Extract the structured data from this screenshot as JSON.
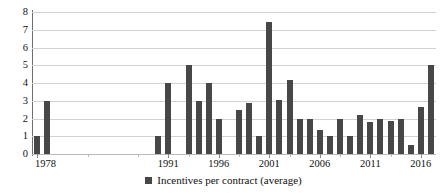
{
  "chart_data": {
    "type": "bar",
    "title": "",
    "xlabel": "",
    "ylabel": "",
    "ylim": [
      0,
      8
    ],
    "yticks": [
      0,
      1,
      2,
      3,
      4,
      5,
      6,
      7,
      8
    ],
    "grid": true,
    "legend_position": "bottom",
    "series_name": "Incentives per contract (average)",
    "bar_color": "#474747",
    "x_tick_labels": [
      "1978",
      "1991",
      "1996",
      "2001",
      "2006",
      "2011",
      "2016"
    ],
    "x_tick_years": [
      1978,
      1991,
      1996,
      2001,
      2006,
      2011,
      2016
    ],
    "x_range": [
      1978,
      2017
    ],
    "categories": [
      "1978",
      "1979",
      "1980",
      "1981",
      "1982",
      "1983",
      "1984",
      "1985",
      "1986",
      "1987",
      "1988",
      "1989",
      "1990",
      "1991",
      "1992",
      "1993",
      "1994",
      "1995",
      "1996",
      "1997",
      "1998",
      "1999",
      "2000",
      "2001",
      "2002",
      "2003",
      "2004",
      "2005",
      "2006",
      "2007",
      "2008",
      "2009",
      "2010",
      "2011",
      "2012",
      "2013",
      "2014",
      "2015",
      "2016",
      "2017"
    ],
    "values": [
      1,
      3,
      null,
      null,
      null,
      null,
      null,
      null,
      null,
      null,
      null,
      null,
      1,
      4,
      null,
      5,
      3,
      4,
      2,
      null,
      2.5,
      2.9,
      1,
      7.45,
      3.05,
      4.15,
      2,
      2,
      1.35,
      1,
      2,
      1,
      2.2,
      1.8,
      2,
      1.85,
      2,
      0.5,
      2.65,
      5
    ]
  },
  "legend": {
    "label": "Incentives per contract (average)",
    "marker": "square-marker"
  }
}
